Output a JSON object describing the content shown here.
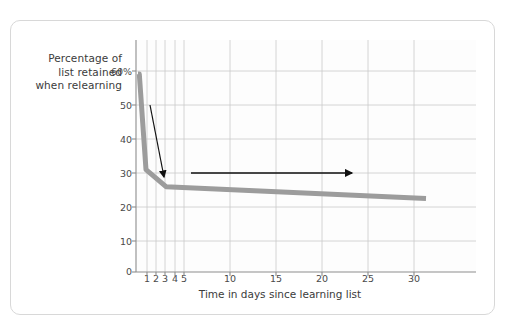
{
  "figure": {
    "background_color": "#ffffff",
    "card_border_color": "#d8d8d8"
  },
  "chart_data": {
    "type": "line",
    "title": "",
    "subtitle": "",
    "xlabel": "Time in days since learning list",
    "ylabel": "Percentage of list retained when relearning",
    "ylabel_lines": [
      "Percentage of",
      "list retained",
      "when relearning"
    ],
    "xlim": [
      0,
      34
    ],
    "ylim": [
      0,
      68
    ],
    "grid": true,
    "legend": "none",
    "series_color": "#9c9c9c",
    "x_ticks": [
      1,
      2,
      3,
      4,
      5,
      10,
      15,
      20,
      25,
      30
    ],
    "x_tick_labels": [
      "1",
      "2",
      "3",
      "4",
      "5",
      "10",
      "15",
      "20",
      "25",
      "30"
    ],
    "y_ticks": [
      0,
      10,
      20,
      30,
      40,
      50,
      60
    ],
    "y_tick_labels": [
      "0",
      "10",
      "20",
      "30",
      "40",
      "50",
      "60%"
    ],
    "series": [
      {
        "name": "Percentage of list retained when relearning",
        "x": [
          0.2,
          0.33,
          1,
          3,
          29
        ],
        "values": [
          58,
          58,
          30,
          25,
          21.5
        ]
      }
    ],
    "annotations": [
      {
        "id": "retention-drops",
        "text_lines": [
          "Retention",
          "drops,"
        ],
        "text": "Retention drops,",
        "arrow": "down-right-diagonal",
        "arrow_from": {
          "x": 1.1,
          "y": 50
        },
        "arrow_to": {
          "x": 2.6,
          "y": 29
        }
      },
      {
        "id": "then-levels-off",
        "text_lines": [
          "then levels off"
        ],
        "text": "then levels off",
        "arrow": "right-horizontal",
        "arrow_from": {
          "x": 5.6,
          "y": 28
        },
        "arrow_to": {
          "x": 22.6,
          "y": 28
        }
      }
    ]
  }
}
